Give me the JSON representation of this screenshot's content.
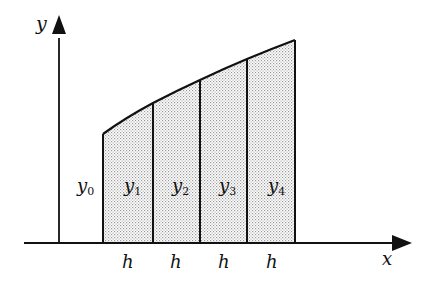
{
  "diagram": {
    "type": "trapezoidal-rule-strips",
    "axes": {
      "x_label": "x",
      "y_label": "y"
    },
    "ordinates": [
      {
        "label": "y",
        "sub": "0"
      },
      {
        "label": "y",
        "sub": "1"
      },
      {
        "label": "y",
        "sub": "2"
      },
      {
        "label": "y",
        "sub": "3"
      },
      {
        "label": "y",
        "sub": "4"
      }
    ],
    "widths": [
      "h",
      "h",
      "h",
      "h"
    ],
    "colors": {
      "stroke": "#111111",
      "fill_dots": "#9a9a9a",
      "background": "#ffffff"
    }
  }
}
